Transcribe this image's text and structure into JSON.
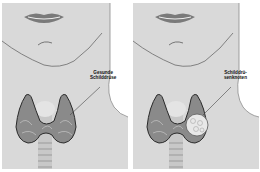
{
  "figure": {
    "panels": [
      {
        "id": "healthy",
        "label_line1": "Gesunde",
        "label_line2": "Schilddrüse",
        "condition": "healthy-thyroid"
      },
      {
        "id": "nodule",
        "label_line1": "Schilddrü-",
        "label_line2": "senknoten",
        "condition": "thyroid-nodule"
      }
    ],
    "colors": {
      "skin": "#d9d9d9",
      "background": "#ffffff",
      "thyroid": "#8a8a8a",
      "thyroid_dark": "#3a3a3a",
      "nodule": "#e8e8e8",
      "trachea": "#c8c8c8",
      "lips": "#7a7a7a"
    }
  }
}
